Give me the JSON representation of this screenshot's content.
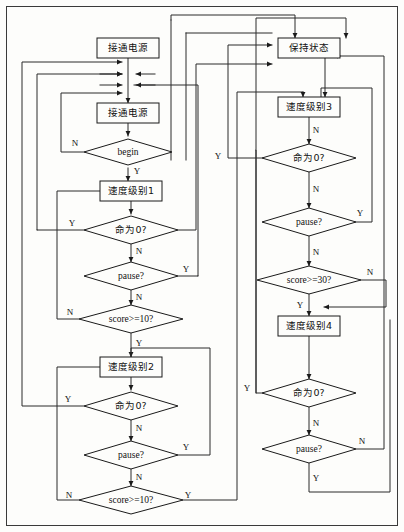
{
  "diagram": {
    "type": "flowchart",
    "canvas": {
      "width": 404,
      "height": 532
    },
    "colors": {
      "background": "#fdfdfb",
      "stroke": "#1a1a1a",
      "edge": "#2a2a2a",
      "text": "#111111"
    },
    "nodes": [
      {
        "id": "n1",
        "shape": "process",
        "label": "接通电源",
        "x": 128,
        "y": 48,
        "w": 62,
        "h": 20
      },
      {
        "id": "n2",
        "shape": "process",
        "label": "接通电源",
        "x": 128,
        "y": 113,
        "w": 62,
        "h": 20
      },
      {
        "id": "n3",
        "shape": "decision",
        "label": "begin",
        "x": 128,
        "y": 152,
        "w": 88,
        "h": 26
      },
      {
        "id": "n4",
        "shape": "process",
        "label": "速度级别1",
        "x": 131,
        "y": 191,
        "w": 62,
        "h": 20
      },
      {
        "id": "n5",
        "shape": "decision",
        "label": "命为0?",
        "x": 131,
        "y": 230,
        "w": 94,
        "h": 28
      },
      {
        "id": "n6",
        "shape": "decision",
        "label": "pause?",
        "x": 131,
        "y": 276,
        "w": 94,
        "h": 28
      },
      {
        "id": "n7",
        "shape": "decision",
        "label": "score>=10?",
        "x": 131,
        "y": 319,
        "w": 104,
        "h": 28
      },
      {
        "id": "n8",
        "shape": "process",
        "label": "速度级别2",
        "x": 131,
        "y": 367,
        "w": 62,
        "h": 20
      },
      {
        "id": "n9",
        "shape": "decision",
        "label": "命为0?",
        "x": 131,
        "y": 406,
        "w": 94,
        "h": 28
      },
      {
        "id": "n10",
        "shape": "decision",
        "label": "pause?",
        "x": 131,
        "y": 455,
        "w": 94,
        "h": 28
      },
      {
        "id": "n11",
        "shape": "decision",
        "label": "score>=10?",
        "x": 131,
        "y": 500,
        "w": 104,
        "h": 28
      },
      {
        "id": "n12",
        "shape": "process",
        "label": "保持状态",
        "x": 309,
        "y": 48,
        "w": 62,
        "h": 20
      },
      {
        "id": "n13",
        "shape": "process",
        "label": "速度级别3",
        "x": 309,
        "y": 107,
        "w": 62,
        "h": 20
      },
      {
        "id": "n14",
        "shape": "decision",
        "label": "命为0?",
        "x": 309,
        "y": 158,
        "w": 94,
        "h": 28
      },
      {
        "id": "n15",
        "shape": "decision",
        "label": "pause?",
        "x": 309,
        "y": 222,
        "w": 94,
        "h": 28
      },
      {
        "id": "n16",
        "shape": "decision",
        "label": "score>=30?",
        "x": 309,
        "y": 280,
        "w": 104,
        "h": 28
      },
      {
        "id": "n17",
        "shape": "process",
        "label": "速度级别4",
        "x": 309,
        "y": 326,
        "w": 62,
        "h": 20
      },
      {
        "id": "n18",
        "shape": "decision",
        "label": "命为0?",
        "x": 309,
        "y": 393,
        "w": 94,
        "h": 28
      },
      {
        "id": "n19",
        "shape": "decision",
        "label": "pause?",
        "x": 309,
        "y": 449,
        "w": 94,
        "h": 28
      }
    ],
    "edge_labels": [
      {
        "id": "e1",
        "text": "N",
        "x": 75,
        "y": 144
      },
      {
        "id": "e2",
        "text": "Y",
        "x": 137,
        "y": 172
      },
      {
        "id": "e3",
        "text": "Y",
        "x": 72,
        "y": 224
      },
      {
        "id": "e4",
        "text": "N",
        "x": 139,
        "y": 252
      },
      {
        "id": "e5",
        "text": "Y",
        "x": 186,
        "y": 270
      },
      {
        "id": "e6",
        "text": "N",
        "x": 139,
        "y": 298
      },
      {
        "id": "e7",
        "text": "N",
        "x": 70,
        "y": 313
      },
      {
        "id": "e8",
        "text": "Y",
        "x": 139,
        "y": 344
      },
      {
        "id": "e9",
        "text": "Y",
        "x": 68,
        "y": 400
      },
      {
        "id": "e10",
        "text": "N",
        "x": 139,
        "y": 429
      },
      {
        "id": "e11",
        "text": "Y",
        "x": 186,
        "y": 448
      },
      {
        "id": "e12",
        "text": "N",
        "x": 139,
        "y": 478
      },
      {
        "id": "e13",
        "text": "N",
        "x": 69,
        "y": 496
      },
      {
        "id": "e14",
        "text": "Y",
        "x": 188,
        "y": 496
      },
      {
        "id": "e15",
        "text": "N",
        "x": 316,
        "y": 131
      },
      {
        "id": "e16",
        "text": "Y",
        "x": 218,
        "y": 157
      },
      {
        "id": "e17",
        "text": "N",
        "x": 316,
        "y": 190
      },
      {
        "id": "e18",
        "text": "Y",
        "x": 360,
        "y": 214
      },
      {
        "id": "e19",
        "text": "N",
        "x": 316,
        "y": 253
      },
      {
        "id": "e20",
        "text": "N",
        "x": 370,
        "y": 273
      },
      {
        "id": "e21",
        "text": "Y",
        "x": 300,
        "y": 306
      },
      {
        "id": "e22",
        "text": "Y",
        "x": 247,
        "y": 389
      },
      {
        "id": "e23",
        "text": "N",
        "x": 316,
        "y": 424
      },
      {
        "id": "e24",
        "text": "N",
        "x": 362,
        "y": 442
      },
      {
        "id": "e25",
        "text": "Y",
        "x": 316,
        "y": 479
      }
    ]
  }
}
